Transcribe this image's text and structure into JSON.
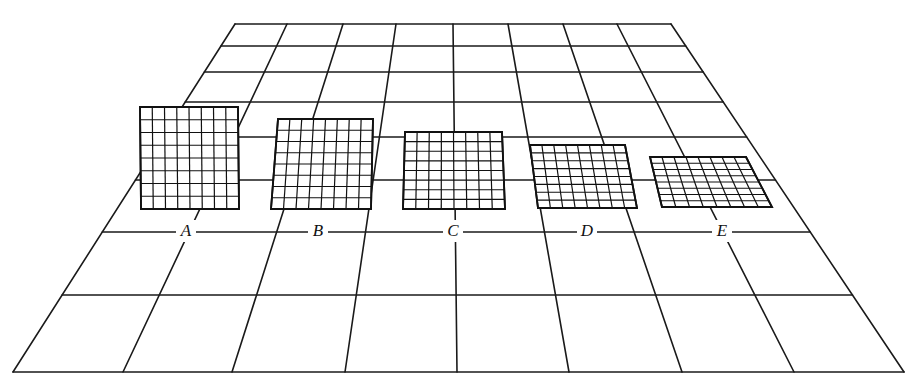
{
  "figure": {
    "ink_color": "#111111",
    "background_color": "#ffffff"
  },
  "floor": {
    "columns": 8,
    "top_y": 24,
    "bottom_y": 372,
    "top_x": [
      235,
      287,
      343,
      396,
      453,
      508,
      563,
      617,
      671
    ],
    "bottom_x": [
      13,
      123,
      232,
      345,
      457,
      569,
      682,
      794,
      904
    ],
    "row_y": [
      24,
      46,
      72,
      102,
      137,
      180,
      232,
      295,
      372
    ]
  },
  "panels": [
    {
      "label": "A",
      "grid": 8,
      "corners": [
        [
          140,
          107
        ],
        [
          238,
          107
        ],
        [
          239,
          209
        ],
        [
          141,
          209
        ]
      ],
      "label_x": 186,
      "label_y": 236
    },
    {
      "label": "B",
      "grid": 8,
      "corners": [
        [
          278,
          119
        ],
        [
          373,
          119
        ],
        [
          371,
          209
        ],
        [
          271,
          209
        ]
      ],
      "label_x": 318,
      "label_y": 236
    },
    {
      "label": "C",
      "grid": 8,
      "corners": [
        [
          405,
          132
        ],
        [
          502,
          132
        ],
        [
          505,
          209
        ],
        [
          403,
          209
        ]
      ],
      "label_x": 453,
      "label_y": 236
    },
    {
      "label": "D",
      "grid": 8,
      "corners": [
        [
          530,
          145
        ],
        [
          625,
          145
        ],
        [
          637,
          208
        ],
        [
          538,
          208
        ]
      ],
      "label_x": 587,
      "label_y": 236
    },
    {
      "label": "E",
      "grid": 8,
      "corners": [
        [
          650,
          157
        ],
        [
          746,
          157
        ],
        [
          772,
          207
        ],
        [
          662,
          207
        ]
      ],
      "label_x": 722,
      "label_y": 236
    }
  ]
}
